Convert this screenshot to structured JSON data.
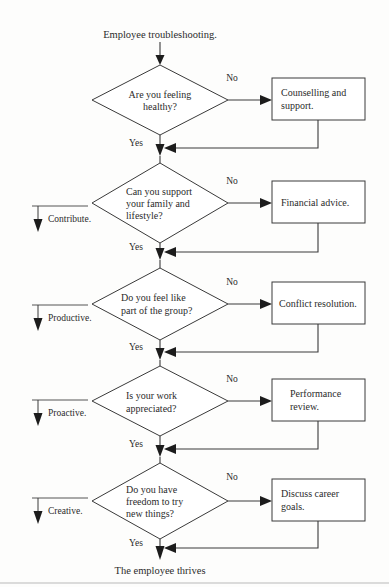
{
  "diagram": {
    "title": "Employee troubleshooting.",
    "terminal": "The employee thrives",
    "branch_no": "No",
    "branch_yes": "Yes",
    "colors": {
      "background": "#fdfdfc",
      "stroke": "#3a3a3a",
      "text": "#2b2b2b",
      "arrow": "#1c1c1c",
      "phase_rule": "#555555",
      "footer_rule": "#b9b9b9"
    },
    "steps": [
      {
        "decision_line1": "Are you feeling",
        "decision_line2": "healthy?",
        "decision_line3": "",
        "process_line1": "Counselling and",
        "process_line2": "support.",
        "no_label": "No",
        "yes_label": "Yes",
        "phase_label": ""
      },
      {
        "decision_line1": "Can you support",
        "decision_line2": "your family and",
        "decision_line3": "lifestyle?",
        "process_line1": "Financial advice.",
        "process_line2": "",
        "no_label": "No",
        "yes_label": "Yes",
        "phase_label": "Contribute."
      },
      {
        "decision_line1": "Do you feel like",
        "decision_line2": "part of the group?",
        "decision_line3": "",
        "process_line1": "Conflict resolution.",
        "process_line2": "",
        "no_label": "No",
        "yes_label": "Yes",
        "phase_label": "Productive."
      },
      {
        "decision_line1": "Is your work",
        "decision_line2": "appreciated?",
        "decision_line3": "",
        "process_line1": "Performance",
        "process_line2": "review.",
        "no_label": "No",
        "yes_label": "Yes",
        "phase_label": "Proactive."
      },
      {
        "decision_line1": "Do you have",
        "decision_line2": "freedom to try",
        "decision_line3": "new things?",
        "process_line1": "Discuss career",
        "process_line2": "goals.",
        "no_label": "No",
        "yes_label": "Yes",
        "phase_label": "Creative."
      }
    ]
  }
}
